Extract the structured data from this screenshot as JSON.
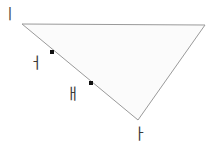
{
  "figure": {
    "type": "geometry-diagram",
    "canvas": {
      "width": 213,
      "height": 156,
      "background": "#ffffff"
    },
    "triangle": {
      "name": "triangle-shape",
      "fill": "#fbfbfb",
      "stroke": "#9a9a9a",
      "stroke_width": 1,
      "vertices": [
        {
          "name": "top-left-vertex",
          "x": 22,
          "y": 24
        },
        {
          "name": "top-right-vertex",
          "x": 205,
          "y": 25
        },
        {
          "name": "bottom-vertex",
          "x": 138,
          "y": 120
        }
      ],
      "points_string": "22,24 205,25 138,120"
    },
    "marked_points": [
      {
        "name": "point-upper",
        "x": 52,
        "y": 52,
        "size": 4,
        "color": "#111111"
      },
      {
        "name": "point-lower",
        "x": 91,
        "y": 83,
        "size": 4,
        "color": "#111111"
      }
    ],
    "labels": [
      {
        "name": "label-top-left",
        "text": "ㅣ",
        "x": 3,
        "y": 7,
        "font_size": 15,
        "color": "#4a4a4a"
      },
      {
        "name": "label-upper-side",
        "text": "ㅓ",
        "x": 29,
        "y": 56,
        "font_size": 15,
        "color": "#3a3a3a"
      },
      {
        "name": "label-lower-side",
        "text": "ㅐ",
        "x": 66,
        "y": 87,
        "font_size": 15,
        "color": "#3a3a3a"
      },
      {
        "name": "label-bottom-vertex",
        "text": "ㅏ",
        "x": 133,
        "y": 127,
        "font_size": 15,
        "color": "#3a3a3a"
      }
    ]
  }
}
